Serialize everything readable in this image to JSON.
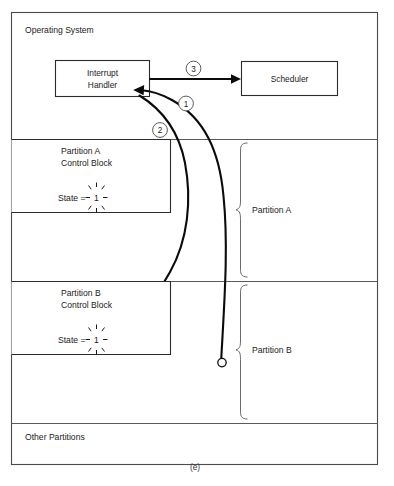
{
  "figure": {
    "caption": "(e)",
    "system_label": "Operating System",
    "other_label": "Other Partitions"
  },
  "blocks": {
    "interrupt_handler": {
      "line1": "Interrupt",
      "line2": "Handler"
    },
    "scheduler": {
      "label": "Scheduler"
    }
  },
  "control_blocks": [
    {
      "title_line1": "Partition A",
      "title_line2": "Control Block",
      "state_label": "State =",
      "state_value": "1"
    },
    {
      "title_line1": "Partition B",
      "title_line2": "Control Block",
      "state_label": "State =",
      "state_value": "1"
    }
  ],
  "braces": [
    {
      "label": "Partition A"
    },
    {
      "label": "Partition B"
    }
  ],
  "flow_markers": [
    {
      "number": "1"
    },
    {
      "number": "2"
    },
    {
      "number": "3"
    }
  ],
  "colors": {
    "ink": "#0b0b0b",
    "frame": "#4a4a4a",
    "divider": "#5a5a5a",
    "brace": "#6a6a6a",
    "paper": "#ffffff"
  }
}
